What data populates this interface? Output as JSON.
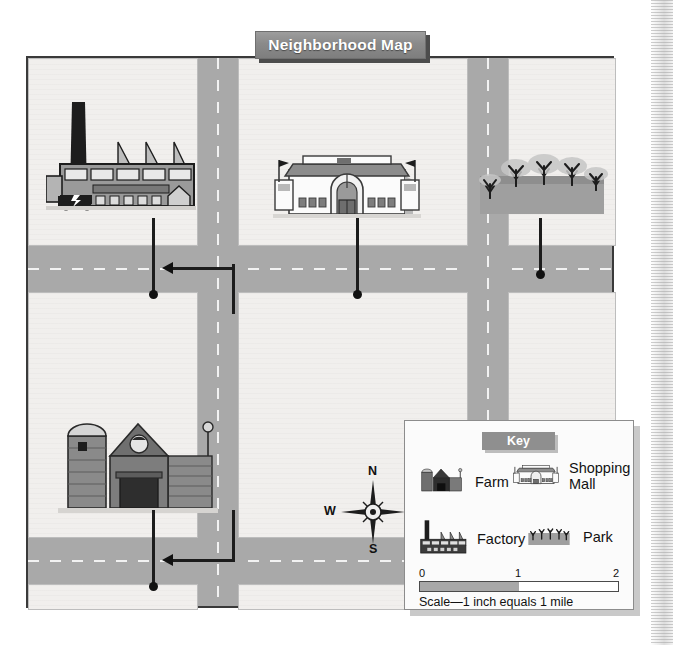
{
  "title": "Neighborhood Map",
  "compass": {
    "north": "N",
    "south": "S",
    "east": "E",
    "west": "W",
    "name": "compass-rose"
  },
  "key": {
    "heading": "Key",
    "items": [
      {
        "icon": "farm-icon",
        "label": "Farm"
      },
      {
        "icon": "shopping-mall-icon",
        "label": "Shopping\nMall"
      },
      {
        "icon": "factory-icon",
        "label": "Factory"
      },
      {
        "icon": "park-icon",
        "label": "Park"
      }
    ],
    "scale": {
      "ticks": [
        "0",
        "1",
        "2"
      ],
      "caption": "Scale—1 inch equals 1 mile",
      "filled_fraction": 0.5
    }
  },
  "map_features": [
    {
      "name": "factory",
      "icon": "factory-icon",
      "block": "top-left"
    },
    {
      "name": "shopping-mall",
      "icon": "shopping-mall-icon",
      "block": "top-center"
    },
    {
      "name": "park",
      "icon": "park-icon",
      "block": "top-right"
    },
    {
      "name": "farm",
      "icon": "farm-icon",
      "block": "mid-left"
    }
  ],
  "colors": {
    "road": "#a9a9a9",
    "block": "#f1efed",
    "map_background": "#eeecea",
    "banner": "#8a8a8a",
    "banner_text": "#ffffff",
    "key_heading": "#8f8f8f",
    "ink": "#111111",
    "scale_fill": "#a8a8a8"
  }
}
